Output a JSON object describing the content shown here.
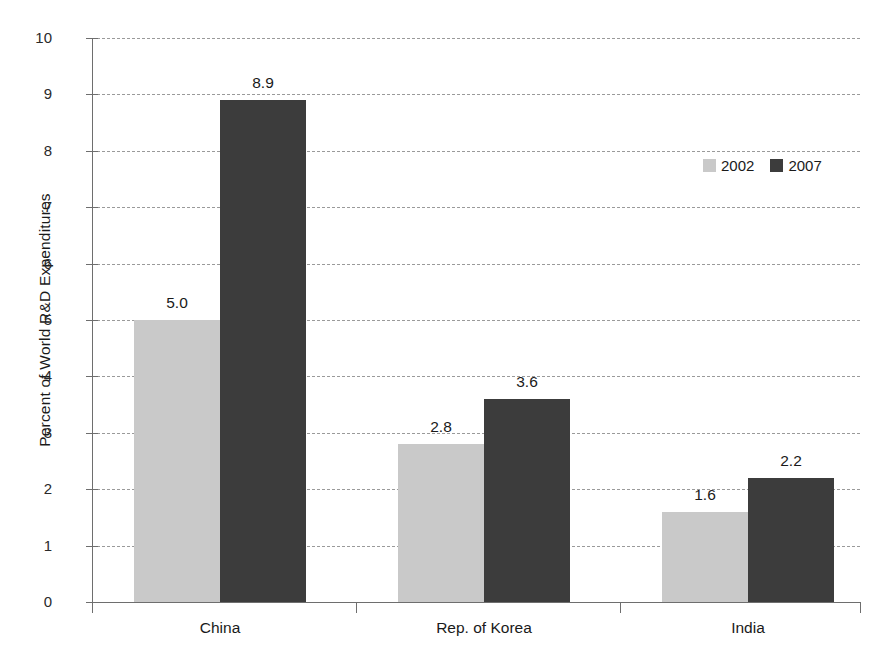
{
  "chart_data": {
    "type": "bar",
    "title": "",
    "subtitle": "",
    "xlabel": "",
    "ylabel": "Percent of World R&D Expenditures",
    "categories": [
      "China",
      "Rep. of Korea",
      "India"
    ],
    "series": [
      {
        "name": "2002",
        "color": "#c9c9c9",
        "values": [
          5.0,
          2.8,
          1.6
        ]
      },
      {
        "name": "2007",
        "color": "#3c3c3c",
        "values": [
          8.9,
          3.6,
          2.2
        ]
      }
    ],
    "data_labels": [
      [
        "5.0",
        "2.8",
        "1.6"
      ],
      [
        "8.9",
        "3.6",
        "2.2"
      ]
    ],
    "ylim": [
      0,
      10
    ],
    "ytick_labels": [
      "0",
      "1",
      "2",
      "3",
      "4",
      "5",
      "6",
      "7",
      "8",
      "9",
      "10"
    ],
    "ytick_values": [
      0,
      1,
      2,
      3,
      4,
      5,
      6,
      7,
      8,
      9,
      10
    ],
    "grid": "horizontal-dashed",
    "legend_position": "upper-right-inside",
    "legend": [
      "2002",
      "2007"
    ],
    "background_color": "#ffffff",
    "axis_color": "#6e6e6e",
    "grid_color": "#9a9a9a"
  }
}
